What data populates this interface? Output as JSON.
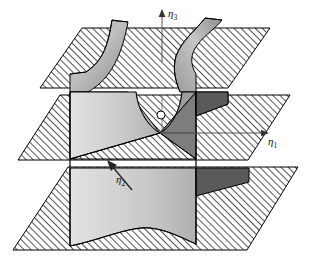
{
  "figure": {
    "name": "cusp-catastrophe-surface-diagram",
    "width": 309,
    "height": 274,
    "background": "#ffffff"
  },
  "axes": [
    {
      "id": "eta3",
      "label_base": "η",
      "label_sub": "3",
      "direction": "up",
      "x": 160,
      "y": 12,
      "arrow_tip_x": 162,
      "arrow_tip_y": 12,
      "arrow_tail_x": 162,
      "arrow_tail_y": 62
    },
    {
      "id": "eta1",
      "label_base": "η",
      "label_sub": "1",
      "direction": "right",
      "x": 272,
      "y": 138,
      "arrow_tip_x": 268,
      "arrow_tip_y": 133,
      "arrow_tail_x": 160,
      "arrow_tail_y": 133
    },
    {
      "id": "eta2",
      "label_base": "η",
      "label_sub": "2",
      "direction": "up-left",
      "x": 117,
      "y": 178,
      "arrow_tip_x": 108,
      "arrow_tip_y": 162,
      "arrow_tail_x": 130,
      "arrow_tail_y": 188
    }
  ],
  "planes": [
    {
      "id": "top-plane",
      "hatched": true,
      "points": "40,88 82,28 270,28 228,88"
    },
    {
      "id": "middle-plane",
      "hatched": true,
      "points": "18,160 60,95 290,95 248,160"
    },
    {
      "id": "bottom-plane",
      "hatched": true,
      "points": "13,250 68,167 298,167 247,250"
    }
  ],
  "colors": {
    "surface_light": "#d2d2d2",
    "surface_mid": "#a8a8a8",
    "surface_dark": "#5a5a5a",
    "hatch_line": "#1a1a1a",
    "outline": "#000000",
    "paper": "#ffffff"
  },
  "surface": {
    "name": "cusp-catastrophe-sheet",
    "description": "folded bifurcation surface crossing three horizontal planes",
    "origin_marker": {
      "cx": 161,
      "cy": 115,
      "r": 4,
      "fill": "#ffffff",
      "stroke": "#000000"
    },
    "cusp_point": {
      "x": 160,
      "y": 133
    }
  }
}
